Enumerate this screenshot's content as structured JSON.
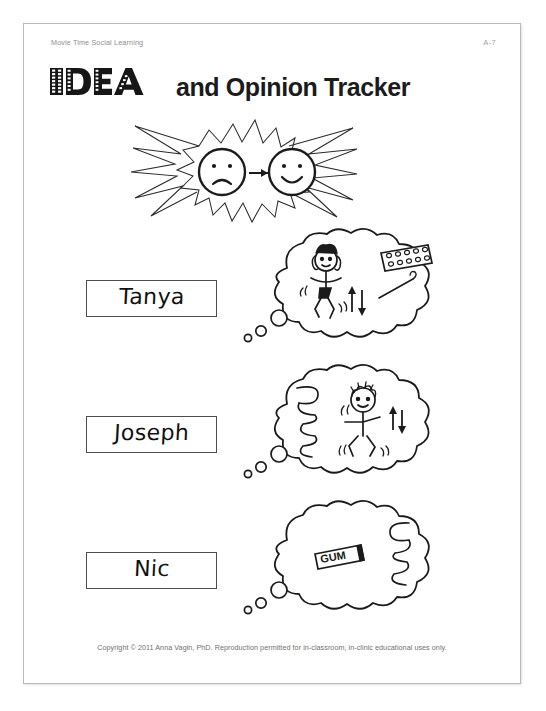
{
  "page": {
    "series_title": "Movie Time Social Learning",
    "page_number": "A-7",
    "title_film_word": "IDEA",
    "title_rest": "and Opinion Tracker",
    "copyright": "Copyright © 2011 Anna Vagin, PhD. Reproduction permitted for in-classroom, in-clinic educational uses only."
  },
  "header_graphic": {
    "name": "starburst-faces",
    "left_face": "sad-face-icon",
    "arrow": "right-arrow-icon",
    "right_face": "happy-face-icon"
  },
  "rows": [
    {
      "name": "Tanya",
      "bubble_name": "thought-bubble-tanya",
      "bubble_contents": [
        "girl-jumping-figure",
        "up-down-arrow-icon",
        "game-board-icon",
        "pointer-icon"
      ]
    },
    {
      "name": "Joseph",
      "bubble_name": "thought-bubble-joseph",
      "bubble_contents": [
        "spring-coil-icon",
        "boy-jumping-figure",
        "up-down-arrow-icon"
      ]
    },
    {
      "name": "Nic",
      "bubble_name": "thought-bubble-nic",
      "bubble_contents": [
        "gum-pack-icon",
        "spring-coil-icon"
      ],
      "gum_label": "GUM"
    }
  ],
  "colors": {
    "ink": "#1b1b1b",
    "page_border": "#b9b9b9",
    "muted_text": "#8e8e8e",
    "box_border": "#4d4d4d",
    "page_background": "#ffffff"
  }
}
